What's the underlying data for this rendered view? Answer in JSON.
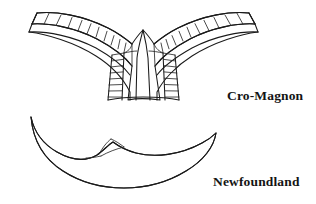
{
  "figure": {
    "type": "line-drawing",
    "background_color": "#ffffff",
    "stroke_color": "#1a1a1a",
    "caption_color": "#141414",
    "specimens": [
      {
        "id": "cro-magnon",
        "label": "Cro-Magnon",
        "description": "Wide curved winged artifact outline with two long arcing bands subdivided by short transverse tick marks, and two vertical ladder-hatched panels flanking a plain central panel",
        "label_position": {
          "x": 227,
          "y": 89
        }
      },
      {
        "id": "newfoundland",
        "label": "Newfoundland",
        "description": "Plain crescent-shaped artifact outline with a small raised notch and short internal facet lines near the center of the upper edge",
        "label_position": {
          "x": 213,
          "y": 175
        }
      }
    ]
  },
  "labels": {
    "cro_magnon": "Cro-Magnon",
    "newfoundland": "Newfoundland"
  }
}
